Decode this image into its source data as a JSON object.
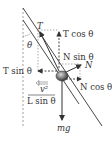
{
  "diagram": {
    "labels": {
      "tension": "T",
      "tension_vertical": "T cos θ",
      "tension_horizontal": "T sin θ",
      "normal": "N",
      "normal_vertical": "N sin θ",
      "normal_horizontal": "N cos θ",
      "centripetal_numerator": "v²",
      "centripetal_denominator": "L sin θ",
      "weight": "mg",
      "angle": "θ"
    },
    "colors": {
      "line": "#333333",
      "dashed": "#777777",
      "ball_light": "#cfcfcf",
      "ball_dark": "#444444"
    }
  }
}
